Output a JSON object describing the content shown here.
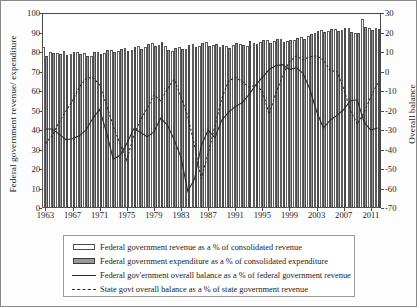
{
  "chart_data": {
    "type": "bar",
    "title": "",
    "ylabel": "Federal government revenue/ expenditure",
    "ylabel_right": "Overall balance",
    "xlabel": "",
    "ylim": [
      0,
      100
    ],
    "ylim_right": [
      -70,
      30
    ],
    "ytick_step": 10,
    "grid": false,
    "legend_position": "bottom",
    "yticks_left": [
      "100",
      "90",
      "80",
      "70",
      "60",
      "50",
      "40",
      "30",
      "20",
      "10",
      "0"
    ],
    "yticks_right": [
      "30",
      "20",
      "10",
      "0",
      "-10",
      "-20",
      "-30",
      "-40",
      "-50",
      "-60",
      "-70"
    ],
    "xtick_labels": [
      "1963",
      "1967",
      "1971",
      "1975",
      "1979",
      "1983",
      "1987",
      "1991",
      "1995",
      "1999",
      "2003",
      "2007",
      "2011"
    ],
    "x": [
      1963,
      1964,
      1965,
      1966,
      1967,
      1968,
      1969,
      1970,
      1971,
      1972,
      1973,
      1974,
      1975,
      1976,
      1977,
      1978,
      1979,
      1980,
      1981,
      1982,
      1983,
      1984,
      1985,
      1986,
      1987,
      1988,
      1989,
      1990,
      1991,
      1992,
      1993,
      1994,
      1995,
      1996,
      1997,
      1998,
      1999,
      2000,
      2001,
      2002,
      2003,
      2004,
      2005,
      2006,
      2007,
      2008,
      2009,
      2010,
      2011,
      2012
    ],
    "series": [
      {
        "name": "Federal government revenue as a % of consolidated revenue",
        "key": "revenue",
        "axis": "left",
        "render": "bar-white",
        "values": [
          82.5,
          80.0,
          79.5,
          80.5,
          79.0,
          80.0,
          79.5,
          78.0,
          80.0,
          79.5,
          81.0,
          80.5,
          82.0,
          81.0,
          83.0,
          82.5,
          84.5,
          83.5,
          83.0,
          80.5,
          82.5,
          81.5,
          84.0,
          83.0,
          85.0,
          83.5,
          82.5,
          83.0,
          83.5,
          84.0,
          83.0,
          84.5,
          85.0,
          86.0,
          85.5,
          86.5,
          85.5,
          86.0,
          87.5,
          88.0,
          90.0,
          91.5,
          91.0,
          92.0,
          91.5,
          92.5,
          90.0,
          97.0,
          92.5,
          92.5
        ]
      },
      {
        "name": "Federal government expenditure as a % of consolidated expenditure",
        "key": "expenditure",
        "axis": "left",
        "render": "bar-gray",
        "values": [
          78.0,
          79.5,
          79.0,
          78.5,
          80.0,
          79.0,
          78.0,
          80.0,
          79.0,
          81.0,
          80.0,
          81.5,
          80.5,
          82.5,
          81.5,
          84.0,
          83.0,
          85.0,
          81.0,
          82.0,
          81.5,
          83.5,
          82.5,
          84.5,
          83.0,
          84.0,
          83.5,
          82.0,
          84.5,
          83.5,
          85.5,
          84.0,
          86.0,
          84.5,
          86.5,
          85.0,
          86.0,
          87.0,
          86.5,
          89.0,
          91.0,
          90.5,
          92.0,
          91.0,
          92.5,
          90.5,
          89.5,
          93.0,
          91.5,
          92.0
        ]
      },
      {
        "name": "Federal gov'ernment overall balance as a % of federal government revenue",
        "key": "federal_balance",
        "axis": "right",
        "render": "line-solid",
        "values": [
          -29.5,
          -29.5,
          -32.0,
          -35.0,
          -34.5,
          -33.0,
          -30.0,
          -24.0,
          -19.5,
          -31.0,
          -45.0,
          -43.0,
          -37.0,
          -29.5,
          -31.0,
          -33.5,
          -31.0,
          -24.0,
          -27.5,
          -35.0,
          -44.0,
          -61.5,
          -55.0,
          -38.0,
          -30.0,
          -34.0,
          -25.0,
          -21.0,
          -18.0,
          -16.0,
          -12.0,
          -7.0,
          -3.0,
          1.0,
          3.0,
          3.5,
          1.0,
          2.0,
          -1.0,
          -9.0,
          -20.5,
          -29.0,
          -25.0,
          -22.5,
          -19.5,
          -15.0,
          -14.5,
          -26.0,
          -30.0,
          -29.0
        ]
      },
      {
        "name": "State govt overall balance as a % of state government revenue",
        "key": "state_balance",
        "axis": "right",
        "render": "line-dashed",
        "values": [
          -37.0,
          -33.0,
          -26.0,
          -20.5,
          -15.0,
          -8.0,
          -3.5,
          -3.0,
          -7.0,
          -17.0,
          -28.0,
          -37.0,
          -45.5,
          -33.0,
          -25.0,
          -19.0,
          -12.0,
          -15.0,
          -9.0,
          -4.0,
          -13.0,
          -23.0,
          -38.0,
          -55.0,
          -42.0,
          -28.0,
          -14.0,
          -5.0,
          -3.0,
          -5.0,
          -8.0,
          -7.0,
          -10.0,
          -22.0,
          -11.0,
          -2.0,
          5.0,
          8.0,
          6.0,
          7.5,
          8.0,
          6.0,
          0.5,
          0.0,
          -9.0,
          -20.0,
          -27.0,
          -21.0,
          -13.0,
          -6.0
        ]
      }
    ]
  },
  "legend": {
    "items": [
      {
        "swatch": "rev",
        "label": "Federal government revenue as a % of consolidated revenue"
      },
      {
        "swatch": "exp",
        "label": "Federal government expenditure as a % of consolidated expenditure"
      },
      {
        "swatch": "line",
        "label": "Federal gov'ernment overall balance as a % of federal government revenue"
      },
      {
        "swatch": "dash",
        "label": "State govt overall balance as a % of state government revenue"
      }
    ]
  },
  "colors": {
    "revenue_bar": "#ffffff",
    "expenditure_bar": "#9a9a9a",
    "line": "#2b2b2b",
    "axis": "#4a4a4a",
    "background": "#ffffff"
  }
}
